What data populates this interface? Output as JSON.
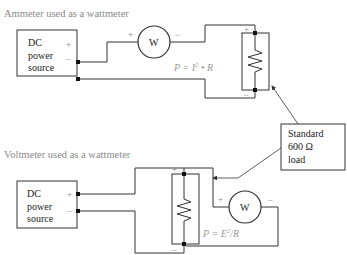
{
  "diagram": {
    "top": {
      "title": "Ammeter used as a wattmeter",
      "source_lines": [
        "DC",
        "power",
        "source"
      ],
      "source_plus": "+",
      "source_minus": "–",
      "meter_label": "W",
      "meter_plus": "+",
      "meter_minus": "–",
      "load_plus": "+",
      "load_minus": "–",
      "formula_main": "P = I",
      "formula_sup": "2",
      "formula_tail": " • R"
    },
    "bottom": {
      "title": "Voltmeter used as a wattmeter",
      "source_lines": [
        "DC",
        "power",
        "source"
      ],
      "source_plus": "+",
      "source_minus": "–",
      "meter_label": "W",
      "meter_plus": "+",
      "meter_minus": "–",
      "load_plus": "+",
      "load_minus": "–",
      "formula_main": "P = E",
      "formula_sup": "2",
      "formula_tail": "/R"
    },
    "callout": {
      "lines": [
        "Standard",
        "600 Ω",
        "load"
      ]
    }
  }
}
